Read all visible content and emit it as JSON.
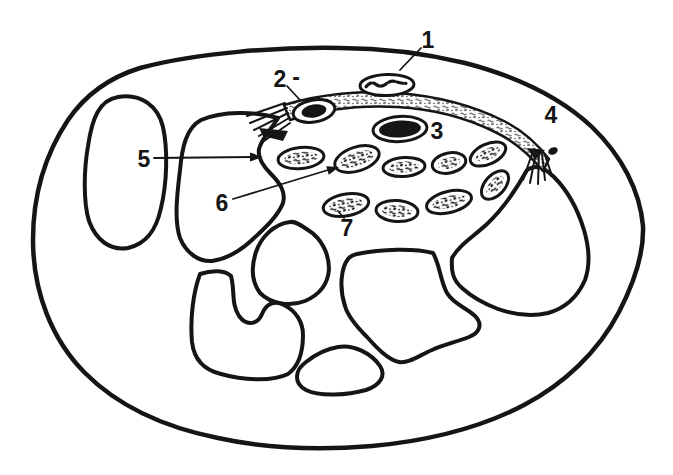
{
  "colors": {
    "ink": "#151515",
    "paper": "#ffffff"
  },
  "labels": [
    {
      "id": "1",
      "text": "1"
    },
    {
      "id": "2",
      "text": "2",
      "dash": "-"
    },
    {
      "id": "3",
      "text": "3"
    },
    {
      "id": "4",
      "text": "4"
    },
    {
      "id": "5",
      "text": "5"
    },
    {
      "id": "6",
      "text": "6"
    },
    {
      "id": "7",
      "text": "7"
    }
  ]
}
